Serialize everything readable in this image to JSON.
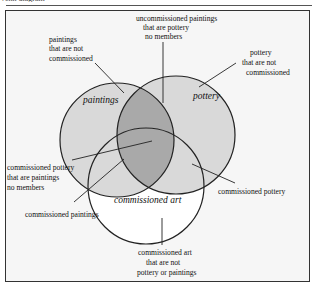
{
  "header": {
    "caption": "Venn diagram"
  },
  "diagram": {
    "type": "venn",
    "sets": [
      {
        "id": "paintings",
        "label": "paintings"
      },
      {
        "id": "pottery",
        "label": "pottery"
      },
      {
        "id": "commissioned",
        "label": "commissioned art"
      }
    ],
    "annotations": {
      "uncommissioned_paintings_pottery": [
        "uncommissioned paintings",
        "that are pottery",
        "no members"
      ],
      "paintings_not_commissioned": [
        "paintings",
        "that are not",
        "commissioned"
      ],
      "pottery_not_commissioned": [
        "pottery",
        "that are not",
        "commissioned"
      ],
      "commissioned_pottery_paintings": [
        "commissioned pottery",
        "that are paintings",
        "no members"
      ],
      "commissioned_paintings": [
        "commissioned paintings"
      ],
      "commissioned_pottery": [
        "commissioned pottery"
      ],
      "commissioned_only": [
        "commissioned art",
        "that are not",
        "pottery or paintings"
      ]
    },
    "colors": {
      "single_region": "#d9d9d9",
      "double_overlap": "#a9a9a9",
      "outline": "#222222",
      "frame_bg": "#f6f6f6"
    }
  }
}
